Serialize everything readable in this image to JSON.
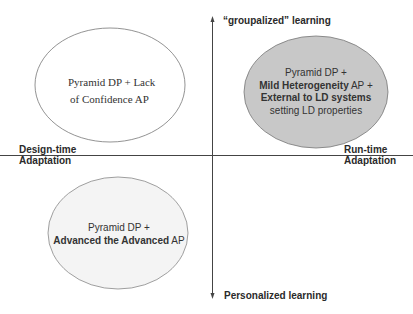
{
  "axes": {
    "top": "“groupalized” learning",
    "bottom": "Personalized learning",
    "left_line1": "Design-time",
    "left_line2": "Adaptation",
    "right_line1": "Run-time",
    "right_line2": "Adaptation"
  },
  "quadrants": {
    "top_left": {
      "line1": "Pyramid DP + Lack",
      "line2": "of Confidence AP",
      "fill": "#ffffff"
    },
    "top_right": {
      "line1": "Pyramid DP +",
      "line2_bold": "Mild Heterogeneity",
      "line2_rest": " AP +",
      "line3_bold": "External to LD systems",
      "line4": "setting LD properties",
      "fill": "#c8c8c8"
    },
    "bottom_left": {
      "line1": "Pyramid DP +",
      "line2_bold": "Advanced the Advanced",
      "line2_rest": " AP",
      "fill": "#f4f4f4"
    }
  },
  "colors": {
    "axis": "#444444",
    "ellipse_stroke": "#777777"
  }
}
